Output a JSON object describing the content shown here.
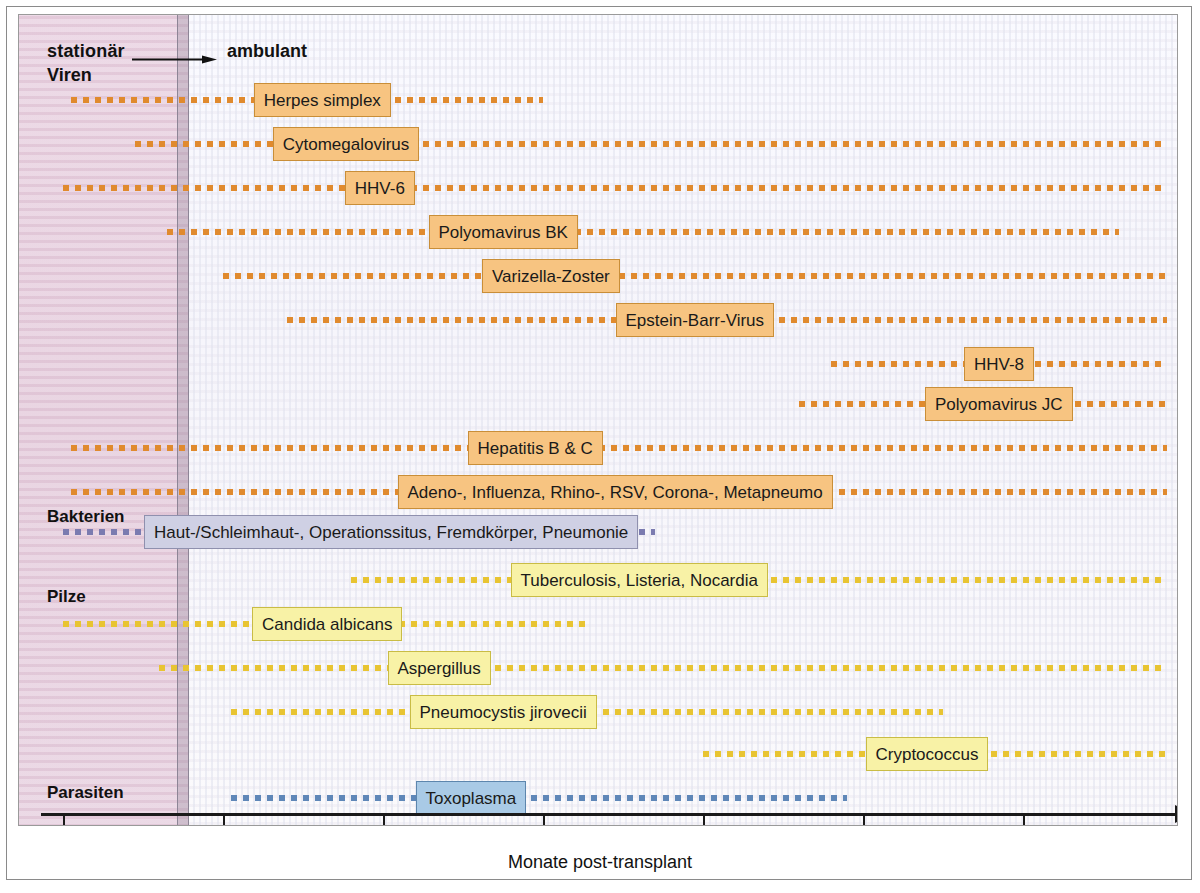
{
  "figure": {
    "axis_title": "Monate post-transplant",
    "phase_left_label": "stationär",
    "phase_right_label": "ambulant",
    "colors": {
      "virus_chip": "#f7c481",
      "virus_dots": "#e08a2e",
      "fungus_chip": "#f8f2a6",
      "fungus_dots": "#e8c432",
      "bacteria_chip": "#cfd0e4",
      "bacteria_dots": "#7b7bb0",
      "parasite_chip": "#a9cae6",
      "parasite_dots": "#5f87b8",
      "stationaer_zone": "#e7d2e0"
    }
  },
  "categories": [
    {
      "id": "viren",
      "label": "Viren"
    },
    {
      "id": "bakterien",
      "label": "Bakterien"
    },
    {
      "id": "pilze",
      "label": "Pilze"
    },
    {
      "id": "parasiten",
      "label": "Parasiten"
    }
  ],
  "chart_data": {
    "type": "table",
    "xlabel": "Monate post-transplant",
    "ylabel": "",
    "xlim": [
      0,
      7
    ],
    "xticks": [
      0,
      1,
      2,
      3,
      4,
      5,
      6
    ],
    "xtick_labels": [
      "0",
      "1",
      "2",
      "3",
      "4",
      "5",
      "6"
    ],
    "grid": false,
    "legend": "none",
    "annotations": [
      "stationär",
      "ambulant",
      "Viren",
      "Bakterien",
      "Pilze",
      "Parasiten"
    ],
    "phases": [
      {
        "name": "stationär",
        "start": 0,
        "end": 0.85
      },
      {
        "name": "ambulant",
        "start": 0.85,
        "end": 7
      }
    ],
    "categories": [
      "Viren",
      "Bakterien",
      "Pilze",
      "Parasiten"
    ],
    "series": [
      {
        "name": "Herpes simplex",
        "group": "Viren",
        "start": 0.05,
        "end": 3.0,
        "label_center": 1.62
      },
      {
        "name": "Cytomegalovirus",
        "group": "Viren",
        "start": 0.45,
        "end": 6.9,
        "label_center": 1.77
      },
      {
        "name": "HHV-6",
        "group": "Viren",
        "start": 0.0,
        "end": 6.9,
        "label_center": 1.98
      },
      {
        "name": "Polyomavirus BK",
        "group": "Viren",
        "start": 0.65,
        "end": 6.6,
        "label_center": 2.75
      },
      {
        "name": "Varizella-Zoster",
        "group": "Viren",
        "start": 1.0,
        "end": 6.9,
        "label_center": 3.05
      },
      {
        "name": "Epstein-Barr-Virus",
        "group": "Viren",
        "start": 1.4,
        "end": 6.9,
        "label_center": 3.95
      },
      {
        "name": "HHV-8",
        "group": "Viren",
        "start": 4.8,
        "end": 6.9,
        "label_center": 5.85
      },
      {
        "name": "Polyomavirus JC",
        "group": "Viren",
        "start": 4.6,
        "end": 6.9,
        "label_center": 5.85
      },
      {
        "name": "Hepatitis B & C",
        "group": "Viren",
        "start": 0.05,
        "end": 6.9,
        "label_center": 2.95
      },
      {
        "name": "Adeno-, Influenza, Rhino-, RSV, Corona-, Metapneumo",
        "group": "Viren",
        "start": 0.05,
        "end": 6.9,
        "label_center": 3.45
      },
      {
        "name": "Haut-/Schleimhaut-, Operationssitus, Fremdkörper, Pneumonie",
        "group": "Bakterien",
        "start": 0.0,
        "end": 3.7,
        "label_center": 2.05
      },
      {
        "name": "Tuberculosis, Listeria, Nocardia",
        "group": "Pilze",
        "start": 1.8,
        "end": 6.9,
        "label_center": 3.6
      },
      {
        "name": "Candida albicans",
        "group": "Pilze",
        "start": 0.0,
        "end": 3.3,
        "label_center": 1.65
      },
      {
        "name": "Aspergillus",
        "group": "Pilze",
        "start": 0.6,
        "end": 6.9,
        "label_center": 2.35
      },
      {
        "name": "Pneumocystis jirovecii",
        "group": "Pilze",
        "start": 1.05,
        "end": 5.5,
        "label_center": 2.75
      },
      {
        "name": "Cryptococcus",
        "group": "Pilze",
        "start": 4.0,
        "end": 6.9,
        "label_center": 5.4
      },
      {
        "name": "Toxoplasma",
        "group": "Parasiten",
        "start": 1.05,
        "end": 4.9,
        "label_center": 2.55
      }
    ]
  }
}
